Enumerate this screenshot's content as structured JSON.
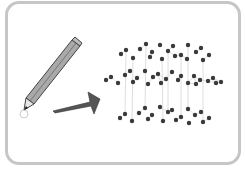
{
  "illustration": {
    "subject": "pencil-to-graphite-structure",
    "colors": {
      "frame": "#c6c6c6",
      "pencil_body": "#a9a9a9",
      "pencil_outline": "#444444",
      "arrow": "#555555",
      "atom": "#3a3a3a",
      "bond": "#d6d6d6"
    },
    "layers": [
      {
        "name": "top",
        "atoms": [
          [
            121,
            54
          ],
          [
            126,
            50
          ],
          [
            133,
            58
          ],
          [
            140,
            49
          ],
          [
            146,
            44
          ],
          [
            150,
            57
          ],
          [
            152,
            52
          ],
          [
            160,
            45
          ],
          [
            162,
            59
          ],
          [
            168,
            51
          ],
          [
            173,
            46
          ],
          [
            175,
            56
          ],
          [
            181,
            55
          ],
          [
            187,
            59
          ],
          [
            188,
            45
          ],
          [
            196,
            52
          ],
          [
            201,
            48
          ],
          [
            203,
            60
          ],
          [
            209,
            55
          ]
        ]
      },
      {
        "name": "middle",
        "atoms": [
          [
            106,
            80
          ],
          [
            111,
            77
          ],
          [
            118,
            83
          ],
          [
            125,
            75
          ],
          [
            130,
            71
          ],
          [
            133,
            82
          ],
          [
            137,
            78
          ],
          [
            145,
            71
          ],
          [
            148,
            84
          ],
          [
            153,
            77
          ],
          [
            158,
            74
          ],
          [
            161,
            83
          ],
          [
            166,
            79
          ],
          [
            172,
            72
          ],
          [
            178,
            80
          ],
          [
            181,
            76
          ],
          [
            188,
            83
          ],
          [
            194,
            76
          ],
          [
            196,
            84
          ],
          [
            200,
            80
          ],
          [
            208,
            81
          ],
          [
            213,
            78
          ],
          [
            216,
            83
          ],
          [
            221,
            82
          ]
        ]
      },
      {
        "name": "bottom",
        "atoms": [
          [
            120,
            118
          ],
          [
            125,
            114
          ],
          [
            132,
            121
          ],
          [
            139,
            113
          ],
          [
            145,
            108
          ],
          [
            148,
            119
          ],
          [
            152,
            115
          ],
          [
            160,
            107
          ],
          [
            163,
            121
          ],
          [
            168,
            112
          ],
          [
            172,
            110
          ],
          [
            176,
            120
          ],
          [
            181,
            117
          ],
          [
            188,
            109
          ],
          [
            189,
            123
          ],
          [
            195,
            115
          ],
          [
            201,
            112
          ],
          [
            203,
            122
          ],
          [
            209,
            118
          ]
        ]
      }
    ]
  }
}
